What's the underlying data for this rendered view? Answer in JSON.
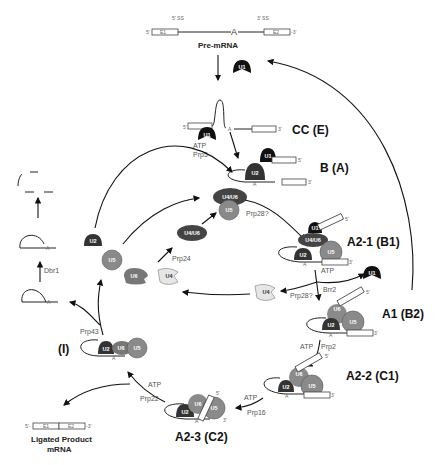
{
  "premrna": {
    "ss5": "5' SS",
    "ss3": "3' SS",
    "end5": "5'",
    "end3": "-3'",
    "exon1": "E1",
    "exon2": "E2",
    "branch": "A",
    "title": "Pre-mRNA"
  },
  "snrnps": {
    "u1": "U1",
    "u2": "U2",
    "u4": "U4",
    "u5": "U5",
    "u6": "U6",
    "u4u6": "U4/U6"
  },
  "stages": {
    "cc": "CC (E)",
    "b": "B (A)",
    "a21": "A2-1 (B1)",
    "a1": "A1 (B2)",
    "a22": "A2-2 (C1)",
    "a23": "A2-3 (C2)",
    "i": "(I)"
  },
  "factors": {
    "atp": "ATP",
    "prp5": "Prp5",
    "prp28q": "Prp28?",
    "prp24": "Prp24",
    "brr2": "Brr2",
    "prp2": "Prp2",
    "prp16": "Prp16",
    "prp22": "Prp22",
    "prp43": "Prp43",
    "dbr1": "Dbr1"
  },
  "product": {
    "line1": "Ligated Product",
    "line2": "mRNA",
    "exon1": "E1",
    "exon2": "E2",
    "end5": "5'-",
    "end3": "-3'"
  },
  "small": {
    "a": "A",
    "five": "5'",
    "three": "3'"
  },
  "colors": {
    "u1": "#111111",
    "u2": "#333333",
    "u4u6": "#444444",
    "u5": "#8a8a8a",
    "u6": "#777777",
    "u4": "#e6e6e6"
  }
}
